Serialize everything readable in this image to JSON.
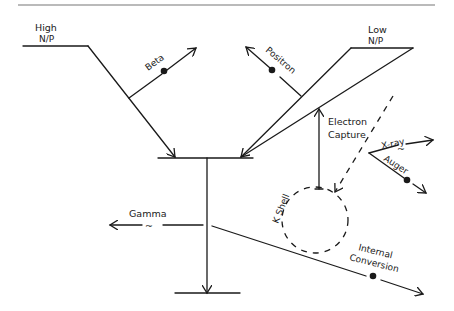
{
  "diagram": {
    "type": "nuclear-decay-schematic",
    "levels": {
      "high": {
        "line1": "High",
        "line2": "N/P"
      },
      "low": {
        "line1": "Low",
        "line2": "N/P"
      }
    },
    "labels": {
      "beta": "Beta",
      "positron": "Positron",
      "electron_capture_1": "Electron",
      "electron_capture_2": "Capture",
      "xray": "X-ray",
      "auger": "Auger",
      "k_shell": "K Shell",
      "gamma": "Gamma",
      "internal_conversion_1": "Internal",
      "internal_conversion_2": "Conversion"
    },
    "symbols": {
      "particle": "filled-dot",
      "photon": "~"
    },
    "colors": {
      "ink": "#1a1a1a",
      "background": "#ffffff"
    }
  }
}
